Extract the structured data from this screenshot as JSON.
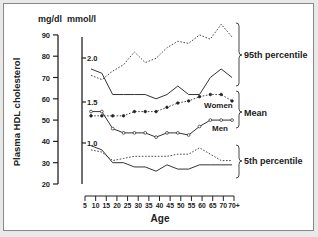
{
  "chart_data": {
    "type": "line",
    "title": "",
    "xlabel": "Age",
    "ylabel": "Plasma HDL cholesterol",
    "y_units_left": "mg/dl",
    "y_units_right": "mmol/l",
    "ylim": [
      20,
      90
    ],
    "y_ticks": [
      20,
      30,
      40,
      50,
      60,
      70,
      80,
      90
    ],
    "y2_ticks": [
      "1.0",
      "1.5",
      "2.0"
    ],
    "x_tick_labels": [
      "5",
      "10",
      "15",
      "20",
      "25",
      "30",
      "35",
      "40",
      "45",
      "50",
      "55",
      "60",
      "65",
      "70",
      "70+"
    ],
    "x": [
      7,
      12,
      16,
      21,
      26,
      31,
      35,
      40,
      46,
      51,
      56,
      61,
      66,
      71
    ],
    "series": [
      {
        "name": "Men 95th percentile",
        "style": "solid",
        "values": [
          74,
          72,
          62,
          62,
          62,
          62,
          60,
          62,
          66,
          62,
          62,
          70,
          74,
          70
        ]
      },
      {
        "name": "Women 95th percentile",
        "style": "dotted",
        "values": [
          71,
          69,
          73,
          76,
          82,
          77,
          79,
          84,
          87,
          86,
          90,
          88,
          95,
          89
        ]
      },
      {
        "name": "Men mean",
        "style": "solid-open-circles",
        "values": [
          54,
          54,
          46,
          44,
          44,
          44,
          42,
          44,
          44,
          43,
          47,
          50,
          50,
          50
        ]
      },
      {
        "name": "Women mean",
        "style": "dotted-filled-circles",
        "values": [
          52,
          52,
          52,
          52,
          54,
          54,
          54,
          56,
          58,
          59,
          61,
          62,
          62,
          59
        ]
      },
      {
        "name": "Men 5th percentile",
        "style": "solid",
        "values": [
          38,
          36,
          30,
          30,
          28,
          28,
          26,
          29,
          27,
          27,
          29,
          29,
          29,
          29
        ]
      },
      {
        "name": "Women 5th percentile",
        "style": "dotted",
        "values": [
          36,
          35,
          31,
          32,
          33,
          33,
          33,
          33,
          34,
          34,
          37,
          34,
          31,
          31
        ]
      }
    ],
    "annotations": [
      "95th percentile",
      "Mean",
      "5th percentile",
      "Women",
      "Men"
    ],
    "grid": false,
    "legend_position": "inline"
  },
  "labels": {
    "ylabel": "Plasma HDL cholesterol",
    "unit_left": "mg/dl",
    "unit_right": "mmol/l",
    "xlabel": "Age",
    "p95": "95th percentile",
    "mean": "Mean",
    "p5": "5th percentile",
    "women": "Women",
    "men": "Men"
  }
}
